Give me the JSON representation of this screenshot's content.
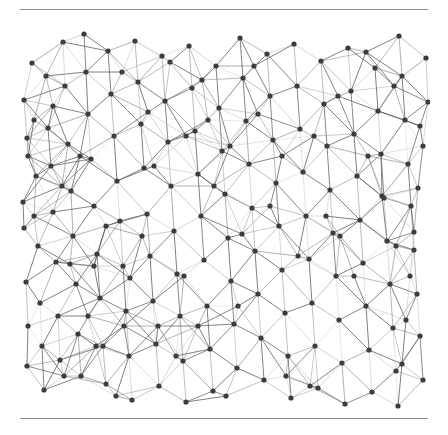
{
  "document": {
    "type": "figure-page",
    "background_color": "#ffffff",
    "rules": {
      "top_label": "horizontal-rule-top",
      "bottom_label": "horizontal-rule-bottom",
      "color": "#8d8d8d"
    },
    "caption": ""
  },
  "figure": {
    "name": "random-geometric-graph",
    "node_color": "#3b3b43",
    "node_radius": 2.6,
    "edge_color_dark": "#55555e",
    "edge_color_light": "#d9d9dd",
    "plot_border": "none",
    "width": 412,
    "height": 396
  },
  "chart_data": {
    "type": "scatter",
    "title": "",
    "xlabel": "",
    "ylabel": "",
    "xlim": [
      0,
      412
    ],
    "ylim": [
      0,
      396
    ],
    "grid": false,
    "legend": null,
    "node_count": 196,
    "edge_count": 470,
    "nodes": [
      [
        6,
        84
      ],
      [
        9,
        122
      ],
      [
        10,
        140
      ],
      [
        5,
        186
      ],
      [
        6,
        212
      ],
      [
        8,
        266
      ],
      [
        10,
        310
      ],
      [
        9,
        350
      ],
      [
        14,
        47
      ],
      [
        16,
        104
      ],
      [
        18,
        160
      ],
      [
        20,
        230
      ],
      [
        22,
        287
      ],
      [
        24,
        330
      ],
      [
        26,
        374
      ],
      [
        28,
        60
      ],
      [
        30,
        112
      ],
      [
        33,
        150
      ],
      [
        35,
        196
      ],
      [
        38,
        246
      ],
      [
        40,
        300
      ],
      [
        42,
        344
      ],
      [
        45,
        26
      ],
      [
        47,
        70
      ],
      [
        50,
        128
      ],
      [
        53,
        175
      ],
      [
        55,
        220
      ],
      [
        58,
        268
      ],
      [
        60,
        318
      ],
      [
        63,
        360
      ],
      [
        66,
        18
      ],
      [
        68,
        56
      ],
      [
        70,
        98
      ],
      [
        73,
        143
      ],
      [
        76,
        190
      ],
      [
        79,
        238
      ],
      [
        82,
        282
      ],
      [
        85,
        330
      ],
      [
        88,
        368
      ],
      [
        90,
        35
      ],
      [
        93,
        78
      ],
      [
        96,
        120
      ],
      [
        99,
        165
      ],
      [
        102,
        205
      ],
      [
        105,
        250
      ],
      [
        108,
        295
      ],
      [
        111,
        340
      ],
      [
        114,
        384
      ],
      [
        117,
        25
      ],
      [
        120,
        66
      ],
      [
        123,
        108
      ],
      [
        126,
        152
      ],
      [
        129,
        198
      ],
      [
        132,
        240
      ],
      [
        135,
        285
      ],
      [
        138,
        328
      ],
      [
        141,
        370
      ],
      [
        144,
        40
      ],
      [
        147,
        85
      ],
      [
        150,
        126
      ],
      [
        153,
        170
      ],
      [
        156,
        215
      ],
      [
        159,
        258
      ],
      [
        162,
        300
      ],
      [
        165,
        345
      ],
      [
        168,
        386
      ],
      [
        171,
        30
      ],
      [
        174,
        72
      ],
      [
        177,
        115
      ],
      [
        180,
        158
      ],
      [
        183,
        200
      ],
      [
        186,
        244
      ],
      [
        189,
        290
      ],
      [
        192,
        333
      ],
      [
        195,
        375
      ],
      [
        198,
        50
      ],
      [
        201,
        92
      ],
      [
        204,
        135
      ],
      [
        207,
        178
      ],
      [
        210,
        222
      ],
      [
        213,
        265
      ],
      [
        216,
        308
      ],
      [
        219,
        352
      ],
      [
        222,
        22
      ],
      [
        225,
        62
      ],
      [
        228,
        105
      ],
      [
        231,
        148
      ],
      [
        234,
        192
      ],
      [
        237,
        235
      ],
      [
        240,
        278
      ],
      [
        243,
        322
      ],
      [
        246,
        364
      ],
      [
        249,
        38
      ],
      [
        252,
        80
      ],
      [
        255,
        124
      ],
      [
        258,
        167
      ],
      [
        261,
        210
      ],
      [
        264,
        254
      ],
      [
        267,
        297
      ],
      [
        270,
        340
      ],
      [
        273,
        382
      ],
      [
        276,
        28
      ],
      [
        279,
        70
      ],
      [
        282,
        113
      ],
      [
        285,
        156
      ],
      [
        288,
        200
      ],
      [
        291,
        243
      ],
      [
        294,
        287
      ],
      [
        297,
        330
      ],
      [
        300,
        372
      ],
      [
        303,
        45
      ],
      [
        306,
        88
      ],
      [
        309,
        130
      ],
      [
        312,
        174
      ],
      [
        315,
        217
      ],
      [
        318,
        260
      ],
      [
        321,
        304
      ],
      [
        324,
        347
      ],
      [
        327,
        388
      ],
      [
        330,
        32
      ],
      [
        333,
        75
      ],
      [
        336,
        118
      ],
      [
        339,
        160
      ],
      [
        342,
        204
      ],
      [
        345,
        247
      ],
      [
        348,
        290
      ],
      [
        351,
        334
      ],
      [
        354,
        376
      ],
      [
        357,
        52
      ],
      [
        360,
        95
      ],
      [
        363,
        138
      ],
      [
        366,
        182
      ],
      [
        369,
        225
      ],
      [
        372,
        268
      ],
      [
        375,
        312
      ],
      [
        378,
        355
      ],
      [
        381,
        20
      ],
      [
        384,
        60
      ],
      [
        387,
        104
      ],
      [
        390,
        148
      ],
      [
        393,
        190
      ],
      [
        396,
        234
      ],
      [
        399,
        278
      ],
      [
        402,
        320
      ],
      [
        405,
        364
      ],
      [
        408,
        42
      ],
      [
        410,
        86
      ],
      [
        405,
        130
      ],
      [
        400,
        172
      ],
      [
        396,
        216
      ],
      [
        392,
        260
      ],
      [
        388,
        304
      ],
      [
        384,
        348
      ],
      [
        380,
        390
      ],
      [
        35,
        90
      ],
      [
        62,
        140
      ],
      [
        88,
        210
      ],
      [
        112,
        262
      ],
      [
        140,
        310
      ],
      [
        168,
        120
      ],
      [
        196,
        170
      ],
      [
        224,
        218
      ],
      [
        252,
        190
      ],
      [
        280,
        240
      ],
      [
        308,
        200
      ],
      [
        336,
        260
      ],
      [
        364,
        180
      ],
      [
        52,
        248
      ],
      [
        78,
        330
      ],
      [
        104,
        56
      ],
      [
        130,
        96
      ],
      [
        158,
        340
      ],
      [
        184,
        64
      ],
      [
        212,
        130
      ],
      [
        240,
        98
      ],
      [
        268,
        360
      ],
      [
        296,
        120
      ],
      [
        322,
        220
      ],
      [
        350,
        140
      ],
      [
        378,
        230
      ],
      [
        44,
        170
      ],
      [
        70,
        300
      ],
      [
        98,
        380
      ],
      [
        124,
        220
      ],
      [
        152,
        46
      ],
      [
        180,
        310
      ],
      [
        208,
        380
      ],
      [
        236,
        50
      ],
      [
        264,
        140
      ],
      [
        292,
        370
      ],
      [
        320,
        80
      ],
      [
        348,
        36
      ],
      [
        376,
        70
      ],
      [
        402,
        110
      ],
      [
        16,
        200
      ],
      [
        46,
        360
      ],
      [
        76,
        250
      ],
      [
        106,
        310
      ],
      [
        136,
        150
      ],
      [
        166,
        260
      ],
      [
        190,
        104
      ],
      [
        220,
        290
      ]
    ],
    "edge_threshold": 46
  }
}
